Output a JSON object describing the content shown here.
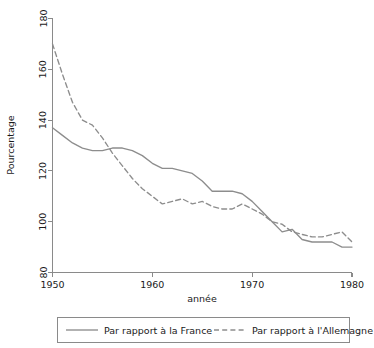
{
  "chart_data": {
    "type": "line",
    "title": "",
    "xlabel": "année",
    "ylabel": "Pourcentage",
    "xlim": [
      1950,
      1980
    ],
    "ylim": [
      80,
      180
    ],
    "xticks": [
      1950,
      1960,
      1970,
      1980
    ],
    "yticks": [
      80,
      100,
      120,
      140,
      160,
      180
    ],
    "grid": false,
    "legend_position": "bottom",
    "x": [
      1950,
      1951,
      1952,
      1953,
      1954,
      1955,
      1956,
      1957,
      1958,
      1959,
      1960,
      1961,
      1962,
      1963,
      1964,
      1965,
      1966,
      1967,
      1968,
      1969,
      1970,
      1971,
      1972,
      1973,
      1974,
      1975,
      1976,
      1977,
      1978,
      1979,
      1980
    ],
    "series": [
      {
        "name": "Par rapport à la France",
        "style": "solid",
        "color": "#8d8d8d",
        "values": [
          137,
          134,
          131,
          129,
          128,
          128,
          129,
          129,
          128,
          126,
          123,
          121,
          121,
          120,
          119,
          116,
          112,
          112,
          112,
          111,
          108,
          104,
          100,
          96,
          97,
          93,
          92,
          92,
          92,
          90,
          90
        ]
      },
      {
        "name": "Par rapport à l'Allemagne",
        "style": "dashed",
        "color": "#8d8d8d",
        "values": [
          170,
          158,
          147,
          140,
          138,
          133,
          127,
          122,
          117,
          113,
          110,
          107,
          108,
          109,
          107,
          108,
          106,
          105,
          105,
          107,
          105,
          103,
          100,
          99,
          96,
          95,
          94,
          94,
          95,
          96,
          92
        ]
      }
    ]
  },
  "axes": {
    "y_label": "Pourcentage",
    "x_label": "année",
    "y_tick_labels": [
      "80",
      "100",
      "120",
      "140",
      "160",
      "180"
    ],
    "x_tick_labels": [
      "1950",
      "1960",
      "1970",
      "1980"
    ]
  },
  "legend": {
    "entries": [
      {
        "label": "Par rapport à la France",
        "style": "solid"
      },
      {
        "label": "Par rapport à l'Allemagne",
        "style": "dashed"
      }
    ]
  }
}
